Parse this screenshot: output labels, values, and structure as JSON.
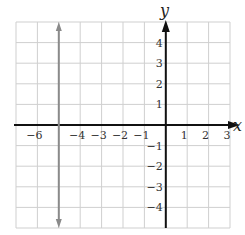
{
  "chart_data": {
    "type": "line",
    "title": "",
    "xlabel": "x",
    "ylabel": "y",
    "xlim": [
      -7,
      3
    ],
    "ylim": [
      -5,
      5
    ],
    "grid": true,
    "x_ticks": [
      "-6",
      "-4",
      "-3",
      "-2",
      "-1",
      "1",
      "2",
      "3"
    ],
    "y_ticks": [
      "4",
      "3",
      "2",
      "1",
      "-1",
      "-2",
      "-3",
      "-4"
    ],
    "series": [
      {
        "name": "x = -5",
        "kind": "vertical-line",
        "x": -5,
        "color": "#8a8a8a",
        "arrows": "both"
      }
    ]
  },
  "labels": {
    "x_axis": "x",
    "y_axis": "y",
    "x_ticks": [
      {
        "v": -6,
        "t": "−6"
      },
      {
        "v": -4,
        "t": "−4"
      },
      {
        "v": -3,
        "t": "−3"
      },
      {
        "v": -2,
        "t": "−2"
      },
      {
        "v": -1,
        "t": "−1"
      },
      {
        "v": 1,
        "t": "1"
      },
      {
        "v": 2,
        "t": "2"
      },
      {
        "v": 3,
        "t": "3"
      }
    ],
    "y_ticks": [
      {
        "v": 4,
        "t": "4"
      },
      {
        "v": 3,
        "t": "3"
      },
      {
        "v": 2,
        "t": "2"
      },
      {
        "v": 1,
        "t": "1"
      },
      {
        "v": -1,
        "t": "−1"
      },
      {
        "v": -2,
        "t": "−2"
      },
      {
        "v": -3,
        "t": "−3"
      },
      {
        "v": -4,
        "t": "−4"
      }
    ]
  }
}
